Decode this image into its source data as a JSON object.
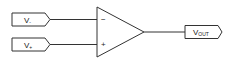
{
  "diagram": {
    "type": "op-amp schematic",
    "inputs": [
      {
        "id": "inverting",
        "label": "V",
        "subscript": "-",
        "pin_symbol": "−"
      },
      {
        "id": "non-inverting",
        "label": "V",
        "subscript": "+",
        "pin_symbol": "+"
      }
    ],
    "output": {
      "label": "V",
      "subscript": "OUT"
    },
    "colors": {
      "stroke": "#333333",
      "text": "#222222",
      "background": "#ffffff"
    }
  }
}
